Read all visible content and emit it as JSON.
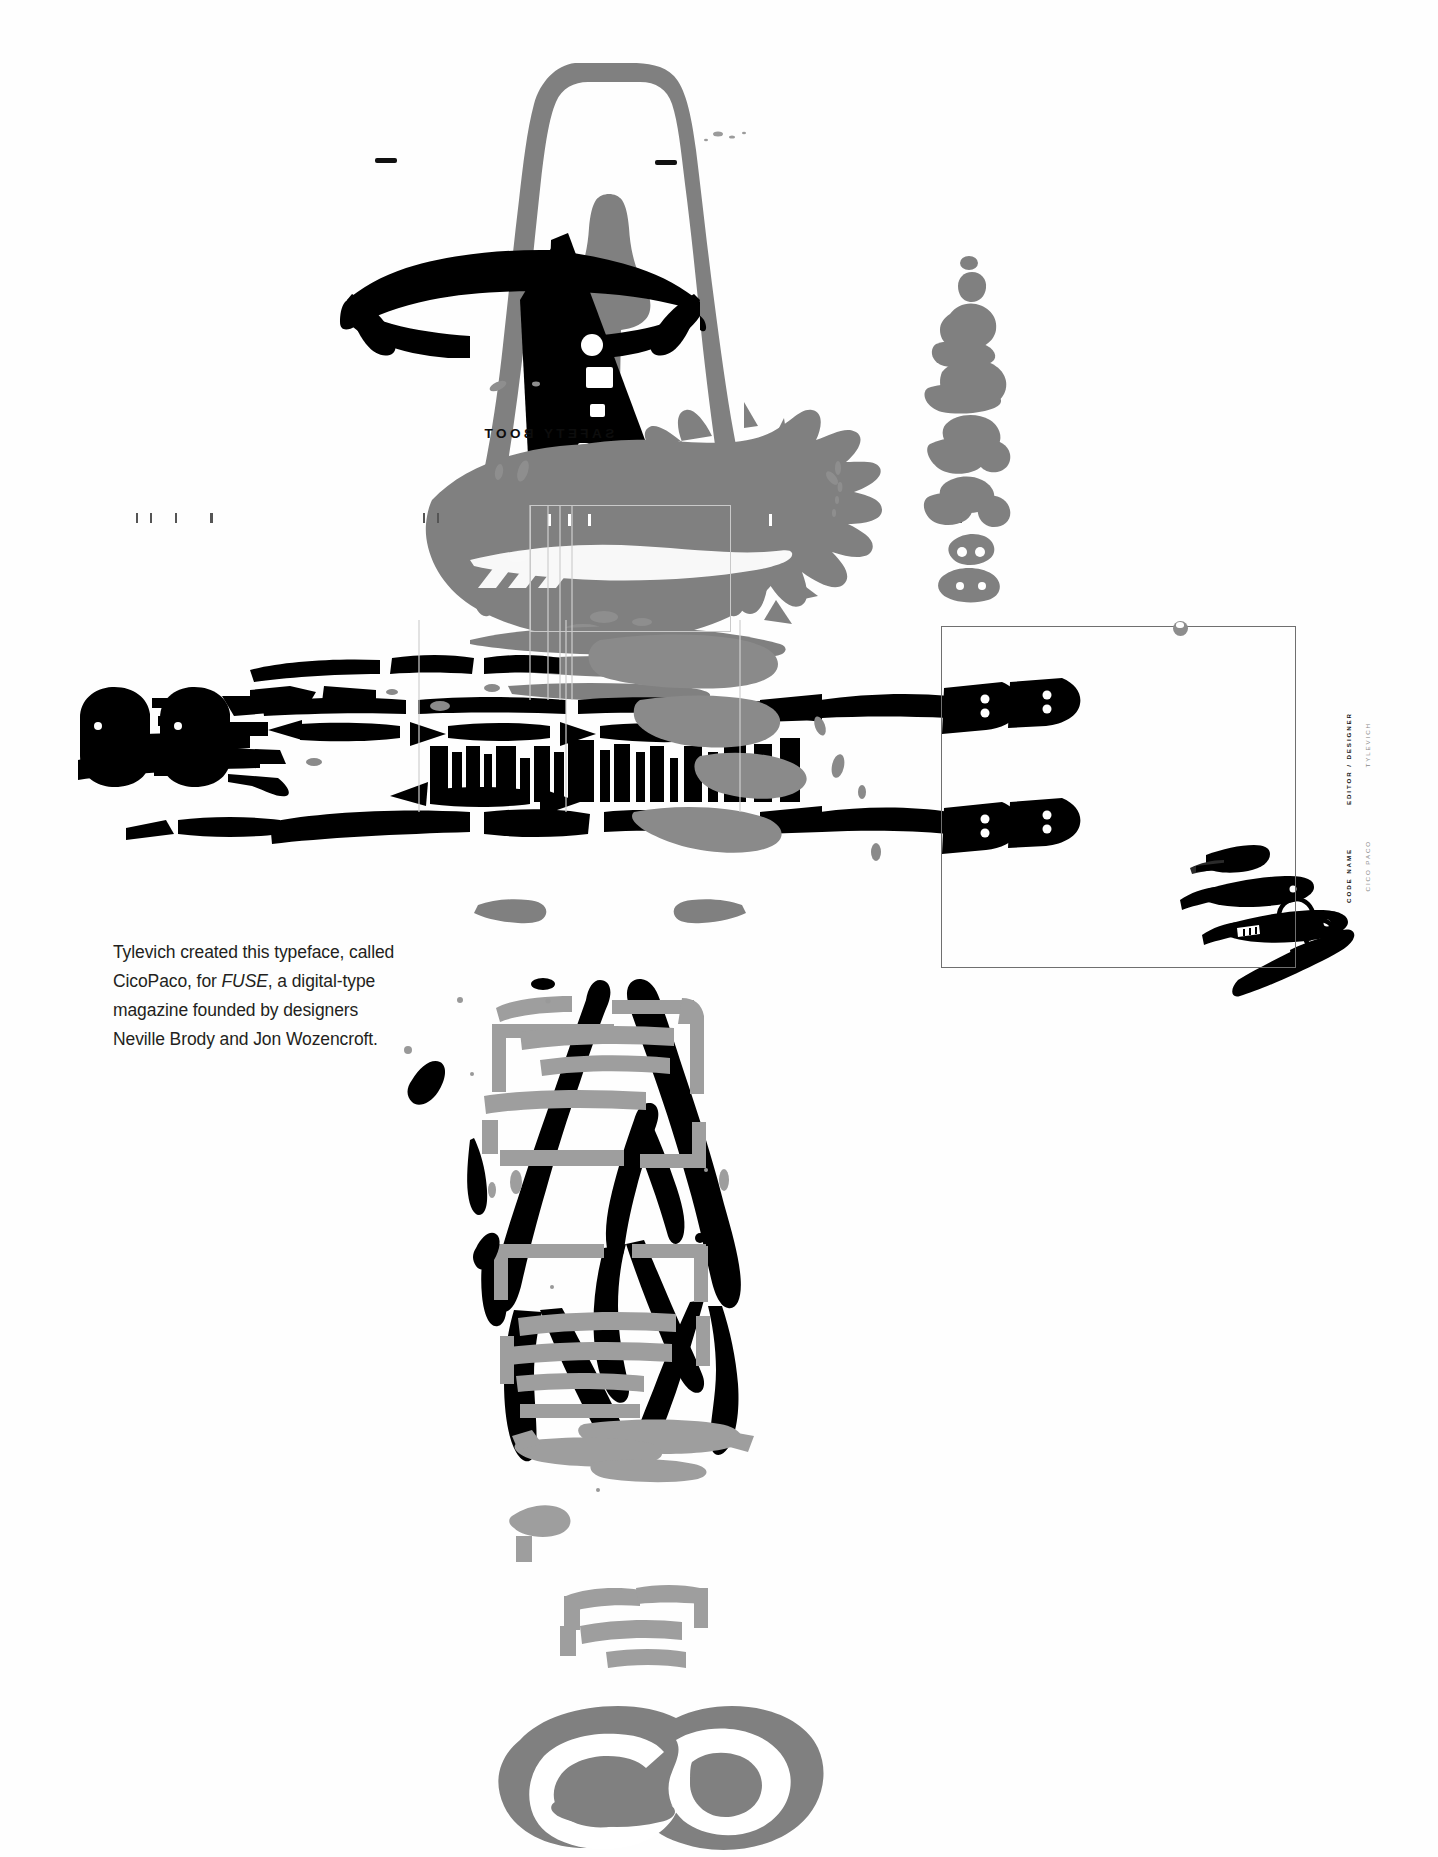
{
  "page": {
    "kind": "typeface-specimen-page",
    "background_color": "#ffffff",
    "ink_black": "#000000",
    "ink_gray": "#808080",
    "rule_gray": "#6f6f6f",
    "width": 1438,
    "height": 1857
  },
  "caption": {
    "line1": "Tylevich created this typeface, called",
    "line2_a": "CicoPaco, for ",
    "line2_italic": "FUSE",
    "line2_b": ", a digital-type",
    "line3": "magazine founded by designers",
    "line4": "Neville Brody and Jon Wozencroft.",
    "full_text": "Tylevich created this typeface, called CicoPaco, for FUSE, a digital-type magazine founded by designers Neville Brody and Jon Wozencroft."
  },
  "credits": {
    "role_label": "EDITOR / DESIGNER",
    "role_value": "TYLEVICH",
    "name_label": "CODE NAME",
    "name_value": "CICO PACO"
  },
  "specimen": {
    "mirrored_label": "SAFETY BOOT",
    "mirrored_inner": "EXHIBIT",
    "mirrored_inner_2": "BUILD",
    "column_glyph_caption": ""
  },
  "artwork": {
    "top_form": "boot-silhouette-gray",
    "wedge": "black-triangle-wedge",
    "splatter": "gray-ink-splatter",
    "mid_band": "horizontal-glyph-band",
    "legs": "black-brushstroke-legs",
    "bottom_glyph": "gray-peanut-glyph",
    "instruments": "surgical-instruments-scalpels-scissors",
    "glyph_column": "vertical-gray-glyph-column"
  }
}
